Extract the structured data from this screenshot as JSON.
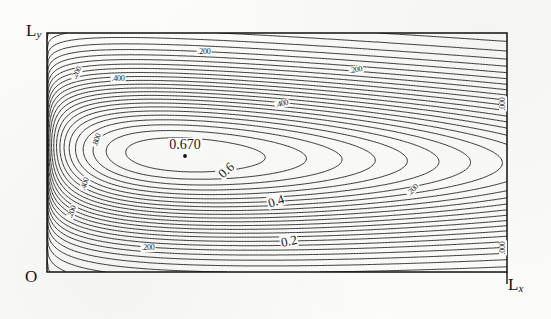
{
  "figure": {
    "kind": "contour-plot",
    "peak_label": "0.670",
    "background": "#fcfcfb",
    "line_color": "#141414"
  },
  "axes": {
    "origin_label": "O",
    "x_label": "L",
    "x_sub": "x",
    "y_label": "L",
    "y_sub": "y",
    "frame": {
      "left": 47,
      "top": 33,
      "right": 507,
      "bottom": 272
    }
  },
  "chart_data": {
    "type": "contour",
    "title": "",
    "xlabel": "Lx",
    "ylabel": "Ly",
    "xlim": [
      0,
      1
    ],
    "ylim": [
      0,
      1
    ],
    "grid": false,
    "legend": "none",
    "peak": {
      "value": 0.67,
      "x": 0.3,
      "y": 0.49,
      "marker": "dot"
    },
    "levels": [
      0.0,
      0.05,
      0.1,
      0.15,
      0.2,
      0.25,
      0.3,
      0.35,
      0.4,
      0.45,
      0.5,
      0.55,
      0.6,
      0.65,
      0.67
    ],
    "inline_labels": [
      {
        "text": "0.670",
        "x": 185,
        "y": 145,
        "rot": 0
      },
      {
        "text": "0.6",
        "x": 226,
        "y": 170,
        "rot": -42
      },
      {
        "text": "0.4",
        "x": 276,
        "y": 201,
        "rot": -18
      },
      {
        "text": "0.2",
        "x": 289,
        "y": 241,
        "rot": -12
      },
      {
        "text": ".200",
        "x": 204,
        "y": 52,
        "rot": 0
      },
      {
        "text": ".400",
        "x": 118,
        "y": 79,
        "rot": 0
      },
      {
        "text": ".400",
        "x": 282,
        "y": 104,
        "rot": -14
      },
      {
        "text": ".200",
        "x": 356,
        "y": 70,
        "rot": -10
      },
      {
        "text": ".200",
        "x": 77,
        "y": 73,
        "rot": -62
      },
      {
        "text": ".800",
        "x": 97,
        "y": 140,
        "rot": -72
      },
      {
        "text": ".400",
        "x": 85,
        "y": 184,
        "rot": -72
      },
      {
        "text": ".200",
        "x": 72,
        "y": 212,
        "rot": -68
      },
      {
        "text": ".200",
        "x": 148,
        "y": 248,
        "rot": 0
      },
      {
        "text": ".200",
        "x": 413,
        "y": 190,
        "rot": -46
      },
      {
        "text": ".000",
        "x": 503,
        "y": 104,
        "rot": -90
      },
      {
        "text": ".000",
        "x": 503,
        "y": 248,
        "rot": -90
      }
    ]
  }
}
